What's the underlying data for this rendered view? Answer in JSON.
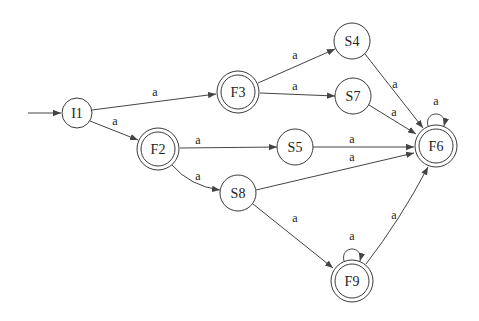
{
  "diagram": {
    "type": "finite-automaton",
    "nodes": [
      {
        "id": "I1",
        "label": "I1",
        "x": 77,
        "y": 113,
        "accepting": false,
        "initial": true
      },
      {
        "id": "F2",
        "label": "F2",
        "x": 158,
        "y": 149,
        "accepting": true
      },
      {
        "id": "F3",
        "label": "F3",
        "x": 238,
        "y": 92,
        "accepting": true
      },
      {
        "id": "S4",
        "label": "S4",
        "x": 352,
        "y": 41,
        "accepting": false
      },
      {
        "id": "S7",
        "label": "S7",
        "x": 353,
        "y": 96,
        "accepting": false
      },
      {
        "id": "S5",
        "label": "S5",
        "x": 295,
        "y": 147,
        "accepting": false
      },
      {
        "id": "S8",
        "label": "S8",
        "x": 238,
        "y": 193,
        "accepting": false
      },
      {
        "id": "F6",
        "label": "F6",
        "x": 436,
        "y": 146,
        "accepting": true
      },
      {
        "id": "F9",
        "label": "F9",
        "x": 352,
        "y": 281,
        "accepting": true
      }
    ],
    "edges": [
      {
        "from": "I1",
        "to": "F3",
        "label": "a"
      },
      {
        "from": "I1",
        "to": "F2",
        "label": "a"
      },
      {
        "from": "F3",
        "to": "S4",
        "label": "a"
      },
      {
        "from": "F3",
        "to": "S7",
        "label": "a"
      },
      {
        "from": "F2",
        "to": "S5",
        "label": "a"
      },
      {
        "from": "F2",
        "to": "S8",
        "label": "a"
      },
      {
        "from": "S4",
        "to": "F6",
        "label": "a"
      },
      {
        "from": "S7",
        "to": "F6",
        "label": "a"
      },
      {
        "from": "S5",
        "to": "F6",
        "label": "a"
      },
      {
        "from": "S8",
        "to": "F6",
        "label": "a"
      },
      {
        "from": "S8",
        "to": "F9",
        "label": "a"
      },
      {
        "from": "F9",
        "to": "F6",
        "label": "a"
      },
      {
        "from": "F6",
        "to": "F6",
        "label": "a"
      },
      {
        "from": "F9",
        "to": "F9",
        "label": "a"
      }
    ]
  }
}
